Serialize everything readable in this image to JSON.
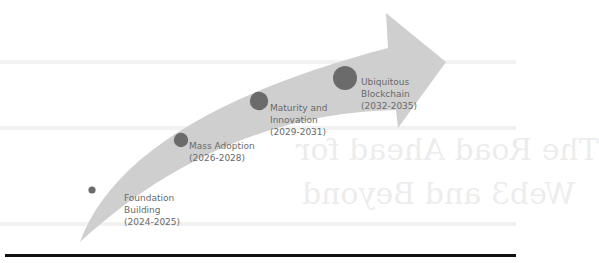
{
  "diagram": {
    "type": "roadmap-arrow",
    "colors": {
      "arrow_fill": "#cfcfcf",
      "milestone_fill": "#6b6b6b",
      "label_text": "#6a6a6a",
      "rule": "#111111"
    },
    "milestones": [
      {
        "title_line1": "Foundation",
        "title_line2": "Building",
        "period": "(2024-2025)"
      },
      {
        "title_line1": "Mass Adoption",
        "title_line2": "",
        "period": "(2026-2028)"
      },
      {
        "title_line1": "Maturity and",
        "title_line2": "Innovation",
        "period": "(2029-2031)"
      },
      {
        "title_line1": "Ubiquitous",
        "title_line2": "Blockchain",
        "period": "(2032-2035)"
      }
    ]
  },
  "background": {
    "ghost_text": {
      "line1": "Chapter",
      "line2": "The Road Ahead for",
      "line3": "Web3 and Beyond"
    }
  }
}
